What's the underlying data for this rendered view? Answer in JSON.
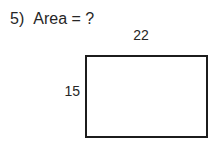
{
  "problem": {
    "number": "5)",
    "question": "Area = ?"
  },
  "figure": {
    "shape": "rectangle",
    "width_label": "22",
    "height_label": "15"
  },
  "colors": {
    "background": "#ffffff",
    "text": "#262626",
    "border": "#1c1c1c"
  }
}
